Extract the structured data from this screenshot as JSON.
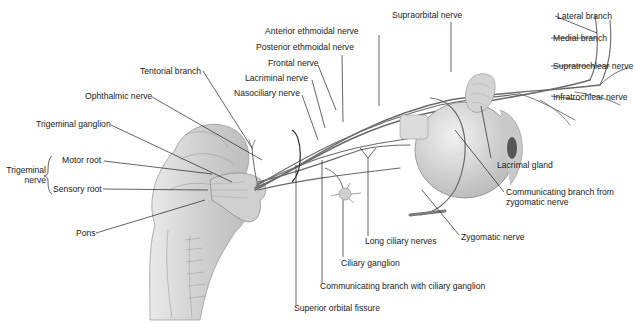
{
  "figure": {
    "colors": {
      "background": "#ffffff",
      "line": "#222222",
      "nerve": "#6e6e6e",
      "tissue": "#d8d8d8"
    },
    "labels": {
      "anterior_ethmoidal_nerve": "Anterior ethmoidal nerve",
      "supraorbital_nerve": "Supraorbital nerve",
      "lateral_branch": "Lateral branch",
      "medial_branch": "Medial branch",
      "posterior_ethmoidal_nerve": "Posterior ethmoidal nerve",
      "frontal_nerve": "Frontal nerve",
      "supratrochlear_nerve": "Supratrochlear nerve",
      "tentorial_branch": "Tentorial branch",
      "lacriminal_nerve": "Lacriminal nerve",
      "nasociliary_nerve": "Nasociliary nerve",
      "infratrochlear_nerve": "Infratrochlear nerve",
      "ophthalmic_nerve": "Ophthalmic nerve",
      "trigeminal_ganglion": "Trigeminal ganglion",
      "trigeminal_nerve_line1": "Trigeminal",
      "trigeminal_nerve_line2": "nerve",
      "motor_root": "Motor root",
      "sensory_root": "Sensory root",
      "lacrimal_gland": "Lacrimal gland",
      "communicating_branch_zygomatic_line1": "Communicating branch from",
      "communicating_branch_zygomatic_line2": "zygomatic nerve",
      "pons": "Pons",
      "long_ciliary_nerves": "Long ciliary nerves",
      "zygomatic_nerve": "Zygomatic nerve",
      "ciliary_ganglion": "Ciliary ganglion",
      "communicating_branch_ciliary": "Communicating branch with ciliary ganglion",
      "superior_orbital_fissure": "Superior orbital fissure"
    }
  }
}
